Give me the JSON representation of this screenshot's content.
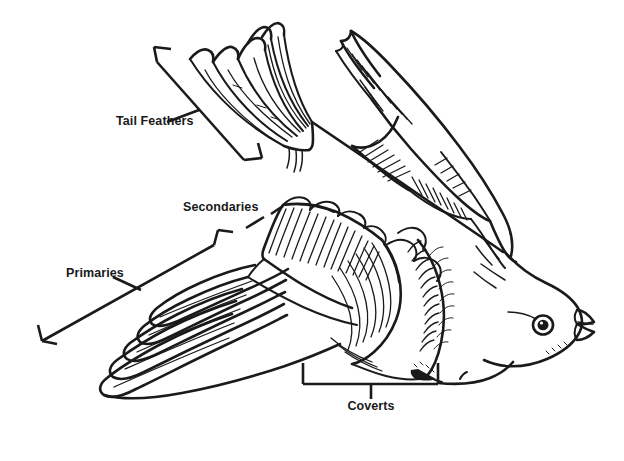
{
  "diagram": {
    "style": "black-and-white-line-drawing",
    "background_color": "#ffffff",
    "ink_color": "#1a1a1a",
    "width": 624,
    "height": 461,
    "labels": [
      {
        "id": "tail-feathers",
        "text": "Tail Feathers",
        "x": 116,
        "y": 125,
        "anchor": "start",
        "callout": "diagonal-bracket",
        "points_to": "tail feather fan at upper left"
      },
      {
        "id": "secondaries",
        "text": "Secondaries",
        "x": 183,
        "y": 211,
        "anchor": "start",
        "callout": "diagonal-bracket",
        "points_to": "inner wing feathers"
      },
      {
        "id": "primaries",
        "text": "Primaries",
        "x": 66,
        "y": 277,
        "anchor": "start",
        "callout": "long-diagonal-bracket",
        "points_to": "outer long wing feathers"
      },
      {
        "id": "coverts",
        "text": "Coverts",
        "x": 371,
        "y": 410,
        "anchor": "middle",
        "callout": "square-bracket-below",
        "points_to": "small feathers covering wing base"
      }
    ],
    "parts": [
      "tail feathers",
      "far wing",
      "near wing primaries",
      "near wing secondaries",
      "coverts",
      "body",
      "head",
      "eye",
      "beak"
    ]
  }
}
